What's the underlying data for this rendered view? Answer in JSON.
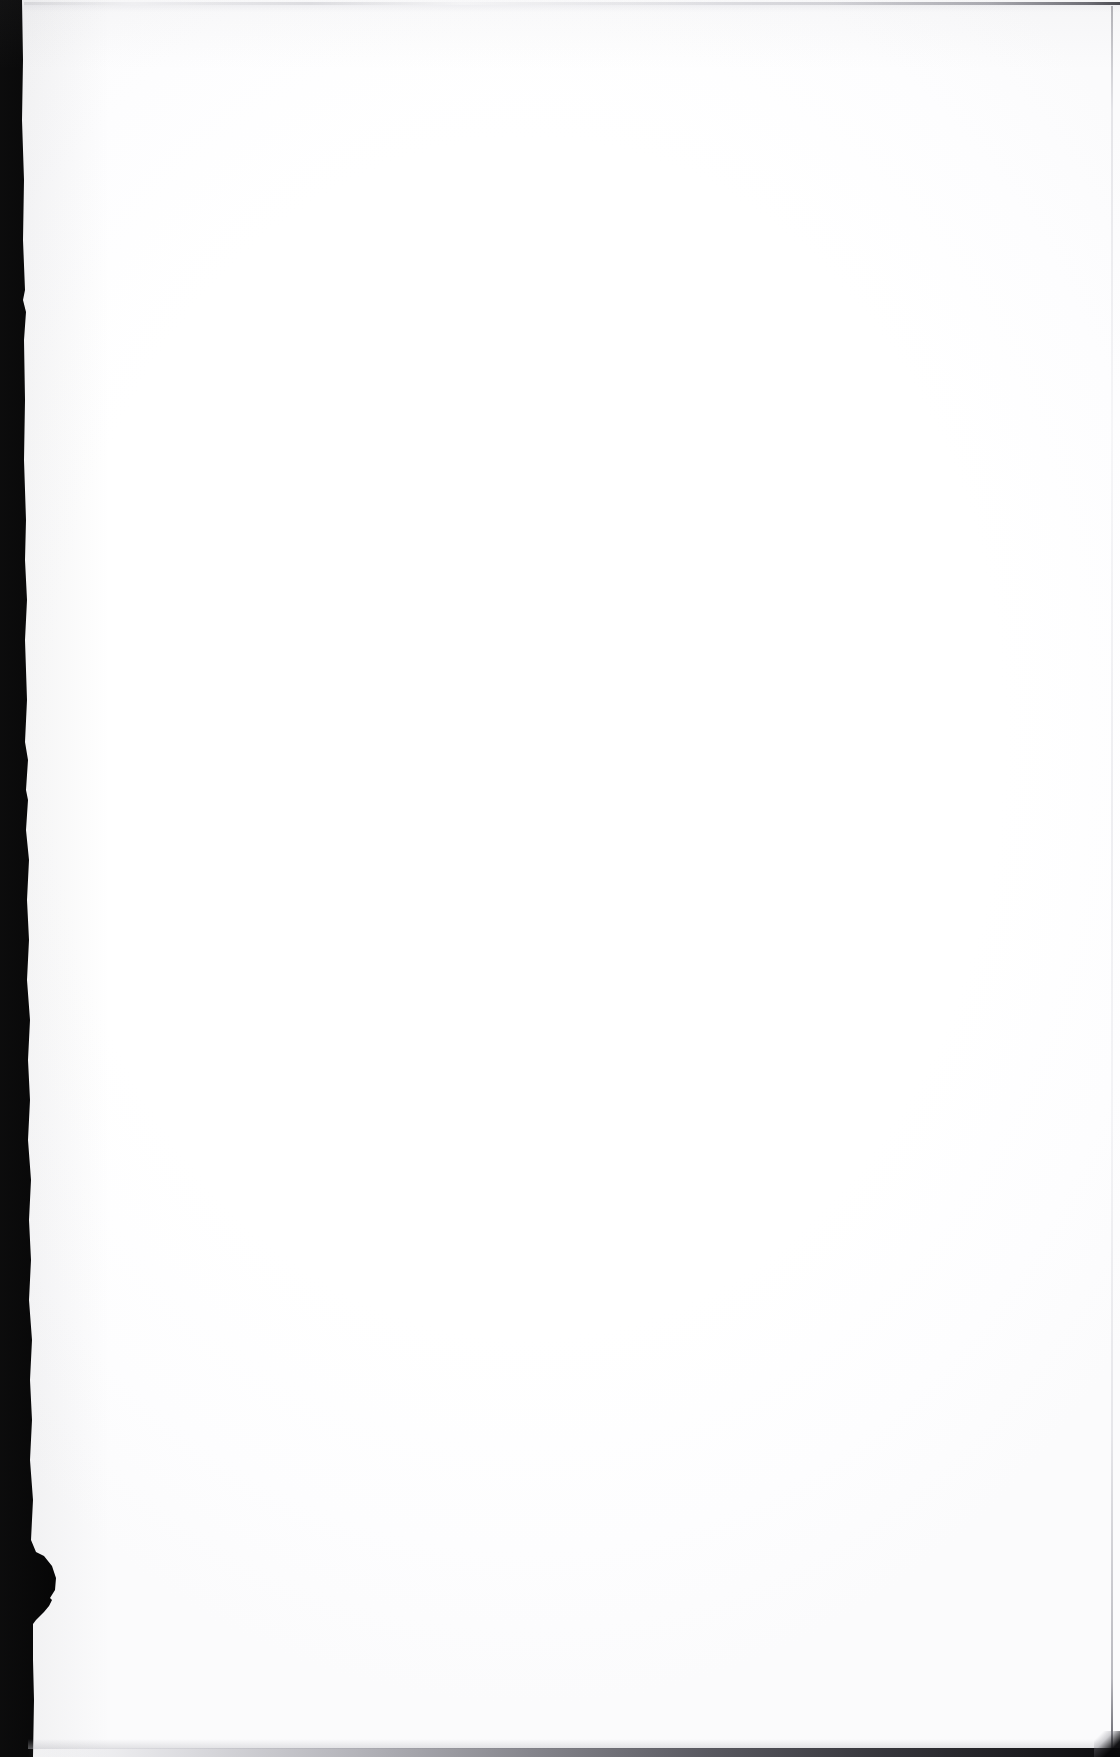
{
  "document": {
    "kind": "scanned-page",
    "title": "Scanned blank page",
    "page_side": "right-hand page",
    "visible_text": "",
    "body_text_lines": [],
    "headings": [],
    "page_number": "",
    "captions": [],
    "footnotes": [],
    "marginalia": [],
    "notes": "No printed or handwritten text is visible anywhere on this page."
  },
  "canvas": {
    "width_px": 1120,
    "height_px": 1757,
    "background_color": "#ffffff"
  },
  "artifacts": {
    "gutter_band": {
      "name": "left-scan-gutter",
      "description": "Solid black binding-shadow band running the full height of the left edge",
      "color": "#000000",
      "top_width_px": 22,
      "mid_width_px": 27,
      "bottom_width_px": 33,
      "bulge": {
        "name": "gutter-bulge",
        "description": "Dark rounded protrusion extending right from the band",
        "top_y_px": 1552,
        "bottom_y_px": 1604,
        "max_x_px": 56
      },
      "notch": {
        "name": "gutter-white-notch",
        "description": "Light wedge-shaped gap cut into the band below the bulge",
        "top_y_px": 1598,
        "bottom_y_px": 1634,
        "left_x_px": 8,
        "right_x_px": 52,
        "color": "#fdfdfd"
      }
    },
    "edges": [
      {
        "name": "top-page-edge",
        "orientation": "horizontal",
        "y_px": 3,
        "color": "#c8c8cd",
        "dark_end": "right"
      },
      {
        "name": "right-page-edge",
        "orientation": "vertical",
        "x_px": 1112,
        "color": "#dcdce1",
        "dark_end": "bottom"
      },
      {
        "name": "bottom-page-edge",
        "orientation": "horizontal",
        "y_px": 1751,
        "color": "#141418",
        "dark_end": "right"
      }
    ],
    "corner": {
      "name": "bottom-right-corner-shadow",
      "color": "#08080a"
    }
  },
  "palette": {
    "paper": "#ffffff",
    "paper_shade": "#fbfbfc",
    "gutter_black": "#000000",
    "edge_gray": "#c8c8cd",
    "edge_dark": "#141418"
  }
}
